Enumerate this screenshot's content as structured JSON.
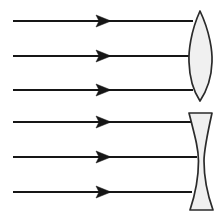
{
  "figure": {
    "title": "Parallel rays incident on converging and diverging lenses",
    "width": 217,
    "height": 213,
    "background_color": "#ffffff"
  },
  "style": {
    "ray_color": "#161616",
    "ray_width": 2.1,
    "lens_outline_color": "#2b2b2b",
    "lens_fill_color": "#f0f0f0",
    "lens_outline_width": 1.7
  },
  "chart_data": {
    "type": "diagram",
    "title": "Parallel rays incident on converging and diverging lenses",
    "xlabel": "",
    "ylabel": "",
    "xlim": [
      0,
      217
    ],
    "ylim": [
      0,
      213
    ],
    "grid": false,
    "legend": "none",
    "elements": [
      {
        "name": "convex-lens",
        "kind": "biconvex-lens",
        "label": "converging lens",
        "x_center": 200,
        "y_top": 11,
        "y_bottom": 101,
        "x_left_vertex": 189,
        "x_right_vertex": 212,
        "fill": "#f0f0f0"
      },
      {
        "name": "concave-lens",
        "kind": "biconcave-lens",
        "label": "diverging lens",
        "x_center": 200,
        "y_top": 113,
        "y_bottom": 210,
        "x_left_edge": 189,
        "x_right_edge": 213,
        "waist_half_width": 4,
        "fill": "#f0f0f0"
      }
    ],
    "rays": [
      {
        "group": "convex",
        "index": 1,
        "y": 21,
        "x_start": 13,
        "x_end": 193,
        "arrow_x": 105
      },
      {
        "group": "convex",
        "index": 2,
        "y": 56,
        "x_start": 13,
        "x_end": 196,
        "arrow_x": 105
      },
      {
        "group": "convex",
        "index": 3,
        "y": 90,
        "x_start": 13,
        "x_end": 193,
        "arrow_x": 105
      },
      {
        "group": "concave",
        "index": 4,
        "y": 122,
        "x_start": 13,
        "x_end": 192,
        "arrow_x": 105
      },
      {
        "group": "concave",
        "index": 5,
        "y": 157,
        "x_start": 13,
        "x_end": 197,
        "arrow_x": 105
      },
      {
        "group": "concave",
        "index": 6,
        "y": 192,
        "x_start": 13,
        "x_end": 192,
        "arrow_x": 105
      }
    ],
    "ray_count": 6,
    "arrow_half_height": 6,
    "arrow_length": 15
  }
}
